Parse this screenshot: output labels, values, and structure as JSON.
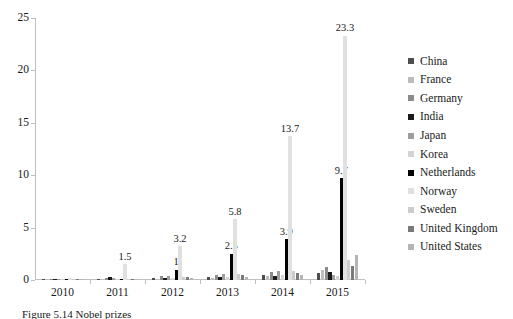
{
  "figure": {
    "caption": "Figure 5.14 Nobel prizes",
    "background": "#ffffff"
  },
  "chart_data": {
    "type": "bar",
    "title": "",
    "xlabel": "",
    "ylabel": "",
    "categories": [
      "2010",
      "2011",
      "2012",
      "2013",
      "2014",
      "2015"
    ],
    "ylim": [
      0,
      25
    ],
    "yticks": [
      0,
      5,
      10,
      15,
      20,
      25
    ],
    "ytick_labels": [
      "0",
      "5",
      "10",
      "15",
      "20",
      "25"
    ],
    "grid": false,
    "legend_position": "right",
    "series": [
      {
        "name": "China",
        "color": "#4d4d4d",
        "values": [
          0.05,
          0.1,
          0.15,
          0.3,
          0.5,
          0.7
        ]
      },
      {
        "name": "France",
        "color": "#bdbdbd",
        "values": [
          0.03,
          0.05,
          0.1,
          0.15,
          0.4,
          1.0
        ]
      },
      {
        "name": "Germany",
        "color": "#8c8c8c",
        "values": [
          0.08,
          0.15,
          0.35,
          0.5,
          0.8,
          1.2
        ]
      },
      {
        "name": "India",
        "color": "#1a1a1a",
        "values": [
          0.04,
          0.25,
          0.2,
          0.3,
          0.35,
          0.8
        ]
      },
      {
        "name": "Japan",
        "color": "#9e9e9e",
        "values": [
          0.1,
          0.2,
          0.35,
          0.6,
          0.9,
          0.5
        ]
      },
      {
        "name": "Korea",
        "color": "#d4d4d4",
        "values": [
          0.05,
          0.1,
          0.2,
          0.3,
          0.45,
          0.35
        ]
      },
      {
        "name": "Netherlands",
        "color": "#000000",
        "values": [
          0.05,
          0.1,
          1.0,
          2.5,
          3.9,
          9.7
        ]
      },
      {
        "name": "Norway",
        "color": "#e0e0e0",
        "values": [
          0.15,
          1.5,
          3.2,
          5.8,
          13.7,
          23.3
        ]
      },
      {
        "name": "Sweden",
        "color": "#cccccc",
        "values": [
          0.06,
          0.12,
          0.25,
          0.55,
          0.9,
          1.9
        ]
      },
      {
        "name": "United Kingdom",
        "color": "#7a7a7a",
        "values": [
          0.07,
          0.1,
          0.3,
          0.5,
          0.7,
          1.3
        ]
      },
      {
        "name": "United States",
        "color": "#b5b5b5",
        "values": [
          0.05,
          0.08,
          0.2,
          0.3,
          0.5,
          2.4
        ]
      }
    ],
    "data_labels": [
      {
        "year": "2011",
        "series": "Norway",
        "text": "1.5"
      },
      {
        "year": "2012",
        "series": "Netherlands",
        "text": "1"
      },
      {
        "year": "2012",
        "series": "Norway",
        "text": "3.2"
      },
      {
        "year": "2013",
        "series": "Netherlands",
        "text": "2.5"
      },
      {
        "year": "2013",
        "series": "Norway",
        "text": "5.8"
      },
      {
        "year": "2014",
        "series": "Netherlands",
        "text": "3.9"
      },
      {
        "year": "2014",
        "series": "Norway",
        "text": "13.7"
      },
      {
        "year": "2015",
        "series": "Netherlands",
        "text": "9.7"
      },
      {
        "year": "2015",
        "series": "Norway",
        "text": "23.3"
      }
    ]
  }
}
